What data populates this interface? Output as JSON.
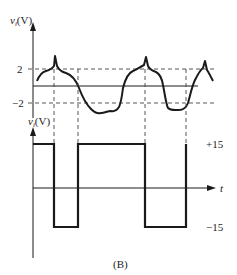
{
  "figure": {
    "caption": "(B)",
    "top_plot": {
      "y_label_main": "v",
      "y_label_sub": "i",
      "y_label_unit": "(V)",
      "ticks": {
        "upper": "2",
        "lower": "−2"
      }
    },
    "bottom_plot": {
      "y_label_main": "v",
      "y_label_sub": "i",
      "y_label_unit": "(V)",
      "levels": {
        "high": "+15",
        "low": "−15"
      },
      "x_label": "t"
    },
    "colors": {
      "ink": "#1a1a1a",
      "dash": "#444444"
    }
  }
}
